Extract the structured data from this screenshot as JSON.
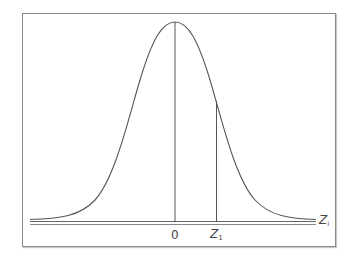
{
  "diagram": {
    "type": "normal-distribution-curve",
    "axis_label": "Z",
    "axis_label_subscript": "i",
    "labels": {
      "mean": "0",
      "z1": "Z",
      "z1_subscript": "1"
    },
    "colors": {
      "curve": "#555555",
      "frame": "#8a8a8a",
      "text": "#444444"
    }
  }
}
